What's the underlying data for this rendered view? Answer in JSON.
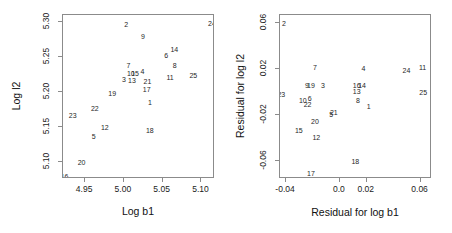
{
  "figure": {
    "background": "#ffffff",
    "point_color": "#262626",
    "axis_color": "#8b8b8b"
  },
  "chart_data": [
    {
      "type": "scatter",
      "title": "",
      "xlabel": "Log b1",
      "ylabel": "Log l2",
      "xlim": [
        4.9215,
        5.1175
      ],
      "ylim": [
        5.0755,
        5.3095
      ],
      "xticks": [
        4.95,
        5.0,
        5.05,
        5.1
      ],
      "xticklabels": [
        "4.95",
        "5.00",
        "5.05",
        "5.10"
      ],
      "yticks": [
        5.1,
        5.15,
        5.2,
        5.25,
        5.3
      ],
      "yticklabels": [
        "5.10",
        "5.15",
        "5.20",
        "5.25",
        "5.30"
      ],
      "grid": false,
      "legend": false,
      "marker_style": "text-label",
      "points": [
        {
          "label": "16",
          "x": 4.9235,
          "y": 5.0795
        },
        {
          "label": "20",
          "x": 4.9455,
          "y": 5.0995
        },
        {
          "label": "5",
          "x": 4.961,
          "y": 5.1375
        },
        {
          "label": "23",
          "x": 4.934,
          "y": 5.1665
        },
        {
          "label": "22",
          "x": 4.9625,
          "y": 5.1775
        },
        {
          "label": "12",
          "x": 4.9755,
          "y": 5.1495
        },
        {
          "label": "18",
          "x": 5.0335,
          "y": 5.1455
        },
        {
          "label": "19",
          "x": 4.985,
          "y": 5.198
        },
        {
          "label": "1",
          "x": 5.0335,
          "y": 5.1855
        },
        {
          "label": "17",
          "x": 5.0295,
          "y": 5.2045
        },
        {
          "label": "3",
          "x": 5.0,
          "y": 5.2175
        },
        {
          "label": "13",
          "x": 5.0105,
          "y": 5.217
        },
        {
          "label": "21",
          "x": 5.0305,
          "y": 5.216
        },
        {
          "label": "10",
          "x": 5.009,
          "y": 5.2265
        },
        {
          "label": "15",
          "x": 5.0145,
          "y": 5.2265
        },
        {
          "label": "11",
          "x": 5.0595,
          "y": 5.2205
        },
        {
          "label": "25",
          "x": 5.0895,
          "y": 5.2245
        },
        {
          "label": "4",
          "x": 5.024,
          "y": 5.23
        },
        {
          "label": "7",
          "x": 5.006,
          "y": 5.2375
        },
        {
          "label": "8",
          "x": 5.0655,
          "y": 5.2375
        },
        {
          "label": "6",
          "x": 5.0545,
          "y": 5.2525
        },
        {
          "label": "14",
          "x": 5.065,
          "y": 5.2605
        },
        {
          "label": "9",
          "x": 5.0245,
          "y": 5.28
        },
        {
          "label": "2",
          "x": 5.003,
          "y": 5.296
        },
        {
          "label": "24",
          "x": 5.1135,
          "y": 5.2985
        }
      ]
    },
    {
      "type": "scatter",
      "title": "",
      "xlabel": "Residual for log b1",
      "ylabel": "Residual for log l2",
      "xlim": [
        -0.0445,
        0.0685
      ],
      "ylim": [
        -0.0755,
        0.0665
      ],
      "xticks": [
        -0.04,
        0.0,
        0.02,
        0.06
      ],
      "xticklabels": [
        "-0.04",
        "0.0",
        "0.02",
        "0.06"
      ],
      "yticks": [
        -0.06,
        -0.02,
        0.02,
        0.06
      ],
      "yticklabels": [
        "-0.06",
        "-0.02",
        "0.02",
        "0.06"
      ],
      "grid": false,
      "legend": false,
      "marker_style": "text-label",
      "points": [
        {
          "label": "2",
          "x": -0.0415,
          "y": 0.06
        },
        {
          "label": "11",
          "x": 0.0615,
          "y": 0.0215
        },
        {
          "label": "24",
          "x": 0.0495,
          "y": 0.019
        },
        {
          "label": "4",
          "x": 0.0175,
          "y": 0.0205
        },
        {
          "label": "7",
          "x": -0.0185,
          "y": 0.0215
        },
        {
          "label": "9",
          "x": -0.0245,
          "y": 0.0055
        },
        {
          "label": "19",
          "x": -0.0215,
          "y": 0.0055
        },
        {
          "label": "3",
          "x": -0.0125,
          "y": 0.0055
        },
        {
          "label": "16",
          "x": 0.0125,
          "y": 0.0055
        },
        {
          "label": "14",
          "x": 0.0165,
          "y": 0.0055
        },
        {
          "label": "13",
          "x": 0.0125,
          "y": 0.001
        },
        {
          "label": "25",
          "x": 0.062,
          "y": -0.0005
        },
        {
          "label": "23",
          "x": -0.0435,
          "y": -0.0015
        },
        {
          "label": "10",
          "x": -0.0275,
          "y": -0.0075
        },
        {
          "label": "6",
          "x": -0.0225,
          "y": -0.0055
        },
        {
          "label": "22",
          "x": -0.024,
          "y": -0.0105
        },
        {
          "label": "8",
          "x": 0.0135,
          "y": -0.0075
        },
        {
          "label": "1",
          "x": 0.0215,
          "y": -0.0125
        },
        {
          "label": "5",
          "x": -0.0065,
          "y": -0.019
        },
        {
          "label": "21",
          "x": -0.0045,
          "y": -0.0175
        },
        {
          "label": "20",
          "x": -0.0185,
          "y": -0.025
        },
        {
          "label": "15",
          "x": -0.0305,
          "y": -0.0335
        },
        {
          "label": "12",
          "x": -0.0175,
          "y": -0.039
        },
        {
          "label": "18",
          "x": 0.0115,
          "y": -0.0595
        },
        {
          "label": "17",
          "x": -0.0215,
          "y": -0.0705
        }
      ]
    }
  ]
}
